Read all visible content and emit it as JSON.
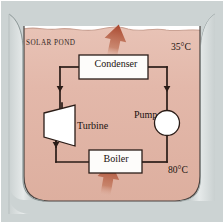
{
  "diagram": {
    "pond_label": "SOLAR POND",
    "temperatures": {
      "top": "35°C",
      "bottom": "80°C"
    },
    "components": [
      {
        "id": "condenser",
        "label": "Condenser",
        "shape": "rectangle"
      },
      {
        "id": "turbine",
        "label": "Turbine",
        "shape": "trapezoid"
      },
      {
        "id": "pump",
        "label": "Pump",
        "shape": "circle"
      },
      {
        "id": "boiler",
        "label": "Boiler",
        "shape": "rectangle"
      }
    ],
    "heat_arrows": [
      {
        "id": "heat-rejected-arrow",
        "direction": "up",
        "location": "above-condenser"
      },
      {
        "id": "heat-added-arrow",
        "direction": "up",
        "location": "below-boiler"
      }
    ],
    "flow_arrows": [
      {
        "id": "flow-left-down",
        "direction": "down"
      },
      {
        "id": "flow-right-down",
        "direction": "down"
      },
      {
        "id": "flow-left-lower",
        "direction": "down"
      },
      {
        "id": "flow-bottom-left",
        "direction": "left"
      }
    ],
    "colors": {
      "background": "#ccd3d3",
      "water": "#e3b8aa",
      "bank": "#b9c2c2",
      "pipe": "#2a1c17",
      "arrow_heat": "#b4543c",
      "box_fill": "#fdfcfa",
      "text": "#1a1210"
    }
  }
}
